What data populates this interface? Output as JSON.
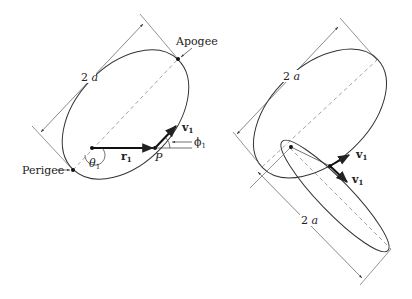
{
  "left_figure": {
    "apogee_label": "Apogee",
    "perigee_label": "Perigee",
    "major_axis_label": "2a",
    "position_vector_label": "r",
    "position_vector_sub": "1",
    "velocity_label": "v",
    "velocity_sub": "1",
    "point_label": "P",
    "theta_label": "θ",
    "theta_sub": "1",
    "phi_label": "ϕ",
    "phi_sub": "1"
  },
  "right_figure": {
    "major_axis_label_top": "2a",
    "major_axis_label_bottom": "2a",
    "velocity_label_upper": "v",
    "velocity_label_upper_sub": "1",
    "velocity_label_lower": "v",
    "velocity_label_lower_sub": "1"
  },
  "colors": {
    "ink": "#222222",
    "dim_line": "#555555",
    "dash": "#999999"
  }
}
